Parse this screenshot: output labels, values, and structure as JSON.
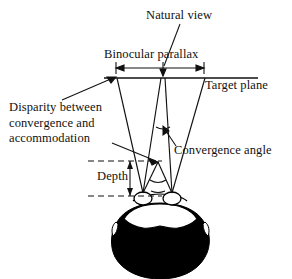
{
  "figure": {
    "type": "line-drawing-diagram",
    "view": "top view of observer head facing a target plane",
    "ink_color": "#111111",
    "background_color": "#ffffff",
    "hair_fill": "#000000"
  },
  "labels": {
    "natural_view": "Natural view",
    "binocular_parallax": "Binocular  parallax",
    "target_plane": "Target plane",
    "disparity_line1": "Disparity between",
    "disparity_line2": "convergence and",
    "disparity_line3": "accommodation",
    "convergence_angle": "Convergence  angle",
    "depth": "Depth"
  },
  "geometry": {
    "target_plane_y": 78,
    "target_plane_x1": 104,
    "target_plane_x2": 258,
    "left_target_x": 117,
    "center_target_x": 163,
    "right_target_x": 205,
    "left_eye": {
      "x": 143,
      "y": 198
    },
    "right_eye": {
      "x": 172,
      "y": 198
    },
    "convergence_point": {
      "x": 157,
      "y": 163
    },
    "parallax_arrow_x1": 115,
    "parallax_arrow_x2": 205,
    "parallax_arrow_y": 68,
    "depth_dash_top_y": 161,
    "depth_dash_bottom_y": 196,
    "depth_dash_x1": 88,
    "depth_dash_x2": 162,
    "depth_arrow_x": 130
  },
  "annotations": {
    "natural_view_leader": "line from label down to center point on target plane",
    "disparity_leader": "line from label up-right to left intersection on target plane",
    "accommodation_leader": "line from label right to convergence crossing point",
    "convergence_leader": "line from label up-left to angle arc between view lines",
    "parallax_measure": "double-headed horizontal arrow with center tick",
    "depth_measure": "vertical double-headed arrow between two dashed horizontal lines"
  }
}
